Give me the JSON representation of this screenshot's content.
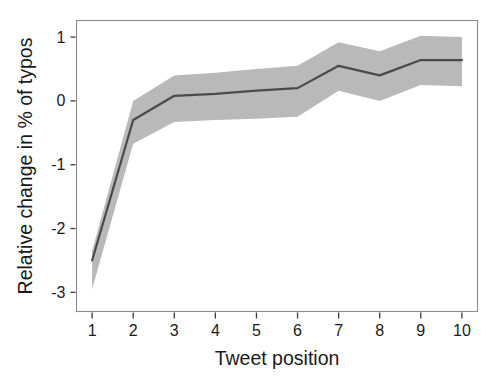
{
  "chart_data": {
    "type": "line",
    "title": "",
    "subtitle": "",
    "xlabel": "Tweet position",
    "ylabel": "Relative change in % of typos",
    "x": [
      1,
      2,
      3,
      4,
      5,
      6,
      7,
      8,
      9,
      10
    ],
    "xtick_labels": [
      "1",
      "2",
      "3",
      "4",
      "5",
      "6",
      "7",
      "8",
      "9",
      "10"
    ],
    "ytick_labels": [
      "1",
      "0",
      "-1",
      "-2",
      "-3"
    ],
    "yticks": [
      1,
      0,
      -1,
      -2,
      -3
    ],
    "xlim": [
      0.62,
      10.38
    ],
    "ylim": [
      -3.3,
      1.26
    ],
    "grid": false,
    "legend": null,
    "series": [
      {
        "name": "Relative change in % of typos",
        "values": [
          -2.5,
          -0.3,
          0.08,
          0.11,
          0.16,
          0.2,
          0.55,
          0.4,
          0.64,
          0.64
        ],
        "ci_lower": [
          -2.95,
          -0.67,
          -0.33,
          -0.3,
          -0.28,
          -0.25,
          0.16,
          0.0,
          0.25,
          0.23
        ],
        "ci_upper": [
          -2.35,
          0.0,
          0.4,
          0.44,
          0.5,
          0.55,
          0.92,
          0.78,
          1.02,
          1.0
        ],
        "line_color": "#4a4a4a",
        "band_color": "#b9b9b9"
      }
    ],
    "annotations": []
  },
  "figure": {
    "background_color": "#ffffff",
    "frame_color": "#8a8a8a"
  }
}
